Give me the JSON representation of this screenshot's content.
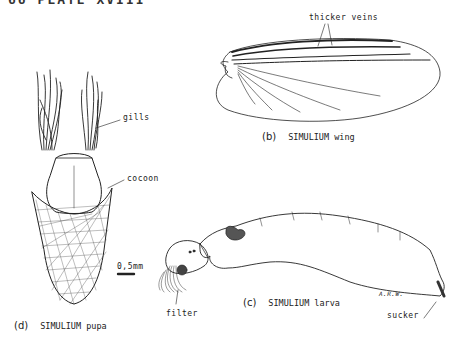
{
  "page_header": "66 PLATE  XVIII",
  "figures": {
    "wing": {
      "caption_letter": "(b)",
      "caption_text": "SIMULIUM wing",
      "annotation": "thicker veins"
    },
    "larva": {
      "caption_letter": "(c)",
      "caption_text": "SIMULIUM larva",
      "annotations": {
        "filter": "filter",
        "sucker": "sucker",
        "signature": "A.R.W."
      }
    },
    "pupa": {
      "caption_letter": "(d)",
      "caption_text": "SIMULIUM pupa",
      "annotations": {
        "gills": "gills",
        "cocoon": "cocoon"
      },
      "scale_bar": "0,5mm"
    }
  }
}
